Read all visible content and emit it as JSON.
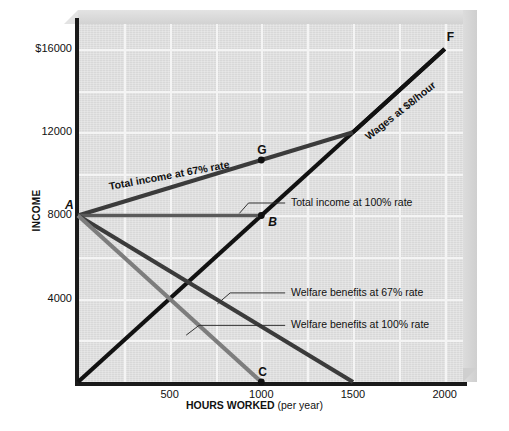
{
  "chart_data": {
    "type": "line",
    "title": "",
    "xlabel": "HOURS WORKED",
    "xlabel_sub": "(per year)",
    "ylabel": "INCOME",
    "xlim": [
      0,
      2100
    ],
    "ylim": [
      0,
      17200
    ],
    "grid": true,
    "x_ticks": [
      {
        "value": 500,
        "label": "500"
      },
      {
        "value": 1000,
        "label": "1000"
      },
      {
        "value": 1500,
        "label": "1500"
      },
      {
        "value": 2000,
        "label": "2000"
      }
    ],
    "y_ticks": [
      {
        "value": 16000,
        "label": "$16000"
      },
      {
        "value": 12000,
        "label": "12000"
      },
      {
        "value": 8000,
        "label": "8000"
      },
      {
        "value": 4000,
        "label": "4000"
      }
    ],
    "series": [
      {
        "name": "Wages at $8/hour",
        "label": "Wages at $8/hour",
        "color": "#111111",
        "width": 4.2,
        "points": [
          [
            0,
            0
          ],
          [
            2000,
            16000
          ]
        ]
      },
      {
        "name": "Total income at 67% rate",
        "label": "Total income at 67% rate",
        "color": "#3b3b3b",
        "width": 4.2,
        "points": [
          [
            0,
            8000
          ],
          [
            1500,
            12000
          ]
        ]
      },
      {
        "name": "Total income at 100% rate",
        "label": "Total income at 100% rate",
        "color": "#5a5a5a",
        "width": 3.6,
        "points": [
          [
            0,
            8000
          ],
          [
            1000,
            8000
          ]
        ]
      },
      {
        "name": "Welfare benefits at 67% rate",
        "label": "Welfare benefits at 67% rate",
        "color": "#3b3b3b",
        "width": 4.2,
        "points": [
          [
            0,
            8000
          ],
          [
            1500,
            0
          ]
        ]
      },
      {
        "name": "Welfare benefits at 100% rate",
        "label": "Welfare benefits at 100% rate",
        "color": "#7d7d7d",
        "width": 4.2,
        "points": [
          [
            0,
            8000
          ],
          [
            1000,
            0
          ]
        ]
      }
    ],
    "annotated_points": [
      {
        "id": "A",
        "label": "A",
        "x": 0,
        "y": 8000,
        "dot": false,
        "italic": true
      },
      {
        "id": "B",
        "label": "B",
        "x": 1000,
        "y": 8000,
        "dot": true,
        "italic": true
      },
      {
        "id": "C",
        "label": "C",
        "x": 1000,
        "y": 0,
        "dot": true,
        "italic": false
      },
      {
        "id": "F",
        "label": "F",
        "x": 2000,
        "y": 16000,
        "dot": false,
        "italic": false
      },
      {
        "id": "G",
        "label": "G",
        "x": 1000,
        "y": 10667,
        "dot": true,
        "italic": false
      }
    ],
    "callouts": [
      {
        "text": "Total income at 100% rate",
        "x": 1140,
        "y": 8600
      },
      {
        "text": "Welfare benefits at 67% rate",
        "x": 1140,
        "y": 4280
      },
      {
        "text": "Welfare benefits at 100% rate",
        "x": 1140,
        "y": 2720
      }
    ],
    "inline_labels": [
      {
        "text": "Total income at 67% rate",
        "angle": -10.5,
        "x": 110,
        "y": 180
      },
      {
        "text": "Wages at $8/hour",
        "angle": -38.5,
        "x": 370,
        "y": 130
      }
    ],
    "colors": {
      "background": "#e0e0e0",
      "gridline": "#f4f4f4",
      "axis": "#1a1a1a",
      "bevel": "#d8d8d8"
    }
  }
}
